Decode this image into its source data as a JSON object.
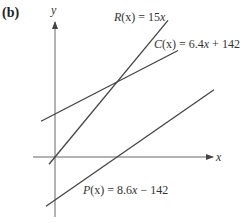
{
  "panel_label": "(b)",
  "chart_data": {
    "type": "line",
    "title": "",
    "xlabel": "x",
    "ylabel": "y",
    "grid": false,
    "series": [
      {
        "name": "R(x) = 15x",
        "function": "R",
        "slope": 15,
        "intercept": 0
      },
      {
        "name": "C(x) = 6.4x + 142",
        "function": "C",
        "slope": 6.4,
        "intercept": 142
      },
      {
        "name": "P(x) = 8.6x − 142",
        "function": "P",
        "slope": 8.6,
        "intercept": -142
      }
    ]
  },
  "labels": {
    "R": {
      "name": "R",
      "rest": "(x) = 15",
      "var": "x"
    },
    "C": {
      "name": "C",
      "rest": "(x) = 6.4",
      "var": "x",
      "tail": " + 142"
    },
    "P": {
      "name": "P",
      "rest": "(x) = 8.6",
      "var": "x",
      "tail": " − 142"
    }
  }
}
